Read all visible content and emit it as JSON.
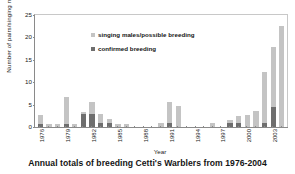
{
  "chart_data": {
    "type": "bar",
    "title": "Annual totals of breeding Cetti's Warblers from 1976-2004",
    "xlabel": "Year",
    "ylabel": "Number of pairs/singing males",
    "ylim": [
      0,
      25
    ],
    "yticks": [
      0,
      5,
      10,
      15,
      20,
      25
    ],
    "grid": false,
    "stacked": true,
    "legend_position": "inside-top-left",
    "categories": [
      "1976",
      "1977",
      "1978",
      "1979",
      "1980",
      "1981",
      "1982",
      "1983",
      "1984",
      "1985",
      "1986",
      "1987",
      "1988",
      "1989",
      "1990",
      "1991",
      "1992",
      "1993",
      "1994",
      "1995",
      "1996",
      "1997",
      "1998",
      "1999",
      "2000",
      "2001",
      "2002",
      "2003",
      "2004"
    ],
    "xtick_labels": [
      "1976",
      "1979",
      "1982",
      "1985",
      "1988",
      "1991",
      "1994",
      "1997",
      "2000",
      "2003"
    ],
    "series": [
      {
        "name": "singing males/possible breeding",
        "color": "#c4c4c4",
        "values": [
          2,
          0.6,
          0.6,
          6,
          0.6,
          0.6,
          2.8,
          2,
          0.9,
          0.6,
          0.6,
          0,
          0,
          0,
          0.8,
          4.8,
          4.8,
          0,
          0,
          0,
          0.8,
          0,
          0.8,
          1.7,
          2.6,
          3.5,
          11.5,
          13.4,
          22.5
        ]
      },
      {
        "name": "confirmed breeding",
        "color": "#6e6e6e",
        "values": [
          0.6,
          0,
          0,
          0.6,
          0,
          2.8,
          2.8,
          0.8,
          0.9,
          0,
          0,
          0,
          0,
          0,
          0,
          0.8,
          0,
          0,
          0,
          0,
          0,
          0,
          0.8,
          0.8,
          0,
          0,
          0.8,
          4.5,
          0
        ]
      }
    ]
  },
  "legend": {
    "items": [
      {
        "label": "singing males/possible breeding",
        "color": "#c4c4c4"
      },
      {
        "label": "confirmed breeding",
        "color": "#6e6e6e"
      }
    ]
  }
}
